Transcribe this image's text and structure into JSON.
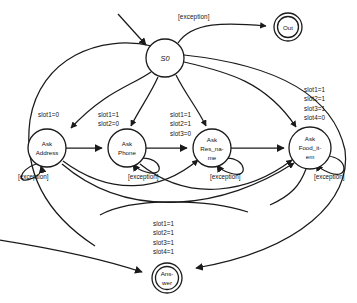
{
  "diagram": {
    "type": "finite-state-machine",
    "background_color": "#ffffff",
    "stroke_color": "#1a1a1a"
  },
  "nodes": [
    {
      "id": "s0",
      "label": "S0",
      "shape": "circle",
      "cx": 165,
      "cy": 58,
      "r": 19,
      "style": "italic"
    },
    {
      "id": "out",
      "label": "Out",
      "shape": "double-circle",
      "cx": 288,
      "cy": 27,
      "r": 14,
      "style": "normal"
    },
    {
      "id": "address",
      "label_line1": "Ask",
      "label_line2": "Address",
      "shape": "circle",
      "cx": 47,
      "cy": 148,
      "r": 19
    },
    {
      "id": "phone",
      "label_line1": "Ask",
      "label_line2": "Phone",
      "shape": "circle",
      "cx": 127,
      "cy": 148,
      "r": 19
    },
    {
      "id": "res_name",
      "label_line1": "Ask",
      "label_line2": "Res_na-",
      "label_line3": "me",
      "shape": "circle",
      "cx": 212,
      "cy": 148,
      "r": 19
    },
    {
      "id": "food_item",
      "label_line1": "Ask",
      "label_line2": "Food_it-",
      "label_line3": "em",
      "shape": "circle",
      "cx": 310,
      "cy": 148,
      "r": 21
    },
    {
      "id": "answer",
      "label_line1": "Ans-",
      "label_line2": "wer",
      "shape": "double-circle",
      "cx": 167,
      "cy": 278,
      "r": 15
    }
  ],
  "guards": [
    {
      "id": "guard-out",
      "lines": "[exception]",
      "x": 178,
      "y": 12,
      "align": "left"
    },
    {
      "id": "guard-address",
      "lines": "slot1=0",
      "x": 38,
      "y": 110,
      "align": "left"
    },
    {
      "id": "guard-phone",
      "lines": "slot1=1\nslot2=0",
      "x": 98,
      "y": 110,
      "align": "left"
    },
    {
      "id": "guard-res-name",
      "lines": "slot1=1\nslot2=1\nslot3=0",
      "x": 170,
      "y": 110,
      "align": "left"
    },
    {
      "id": "guard-food-item",
      "lines": "slot1=1\nslot2=1\nslot3=1\nslot4=0",
      "x": 304,
      "y": 85,
      "align": "left"
    },
    {
      "id": "guard-answer",
      "lines": "slot1=1\nslot2=1\nslot3=1\nslot4=1",
      "x": 153,
      "y": 219,
      "align": "left"
    }
  ],
  "self_loops": [
    {
      "id": "loop-address",
      "label": "[exception]",
      "x": 18,
      "y": 173
    },
    {
      "id": "loop-phone",
      "label": "[exception]",
      "x": 128,
      "y": 173
    },
    {
      "id": "loop-res-name",
      "label": "[exception]",
      "x": 210,
      "y": 173
    },
    {
      "id": "loop-food-item",
      "label": "[exception]",
      "x": 314,
      "y": 173
    }
  ],
  "edges": [
    {
      "from": "start",
      "to": "s0",
      "label": ""
    },
    {
      "from": "s0",
      "to": "out",
      "label": "[exception]"
    },
    {
      "from": "s0",
      "to": "address",
      "label": "slot1=0"
    },
    {
      "from": "s0",
      "to": "phone",
      "label": "slot1=1 slot2=0"
    },
    {
      "from": "s0",
      "to": "res_name",
      "label": "slot1=1 slot2=1 slot3=0"
    },
    {
      "from": "s0",
      "to": "food_item",
      "label": "slot1=1 slot2=1 slot3=1 slot4=0"
    },
    {
      "from": "address",
      "to": "phone",
      "label": ""
    },
    {
      "from": "phone",
      "to": "res_name",
      "label": ""
    },
    {
      "from": "res_name",
      "to": "food_item",
      "label": ""
    },
    {
      "from": "address",
      "to": "res_name",
      "label": ""
    },
    {
      "from": "address",
      "to": "food_item",
      "label": ""
    },
    {
      "from": "phone",
      "to": "food_item",
      "label": ""
    },
    {
      "from": "address",
      "to": "answer",
      "label": "slot1=1 slot2=1 slot3=1 slot4=1"
    },
    {
      "from": "food_item",
      "to": "answer",
      "label": ""
    },
    {
      "from": "address",
      "to": "address",
      "label": "[exception]"
    },
    {
      "from": "phone",
      "to": "phone",
      "label": "[exception]"
    },
    {
      "from": "res_name",
      "to": "res_name",
      "label": "[exception]"
    },
    {
      "from": "food_item",
      "to": "food_item",
      "label": "[exception]"
    }
  ]
}
